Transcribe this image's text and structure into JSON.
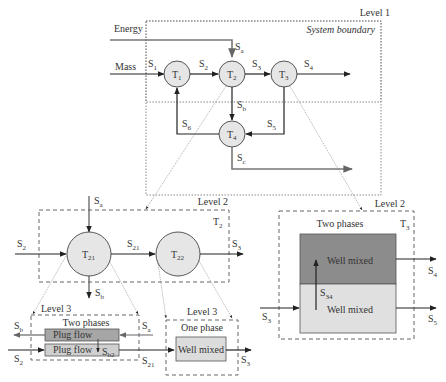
{
  "level1": {
    "label": "Level 1",
    "boundary_label": "System boundary",
    "inputs": {
      "energy": "Energy",
      "mass": "Mass"
    },
    "tanks": [
      {
        "id": "T",
        "sub": "1"
      },
      {
        "id": "T",
        "sub": "2"
      },
      {
        "id": "T",
        "sub": "3"
      },
      {
        "id": "T",
        "sub": "4"
      }
    ],
    "streams": {
      "s1": {
        "s": "S",
        "sub": "1"
      },
      "s2": {
        "s": "S",
        "sub": "2"
      },
      "s3": {
        "s": "S",
        "sub": "3"
      },
      "s4": {
        "s": "S",
        "sub": "4"
      },
      "s5": {
        "s": "S",
        "sub": "5"
      },
      "s6": {
        "s": "S",
        "sub": "6"
      },
      "sa": {
        "s": "S",
        "sub": "a"
      },
      "sb": {
        "s": "S",
        "sub": "b"
      },
      "sc": {
        "s": "S",
        "sub": "c"
      }
    }
  },
  "level2_left": {
    "label": "Level 2",
    "container": {
      "s": "T",
      "sub": "2"
    },
    "tanks": [
      {
        "id": "T",
        "sub": "21"
      },
      {
        "id": "T",
        "sub": "22"
      }
    ],
    "streams": {
      "sa": {
        "s": "S",
        "sub": "a"
      },
      "s2": {
        "s": "S",
        "sub": "2"
      },
      "s21": {
        "s": "S",
        "sub": "21"
      },
      "s3": {
        "s": "S",
        "sub": "3"
      },
      "sb": {
        "s": "S",
        "sub": "b"
      }
    }
  },
  "level3_left": {
    "label": "Level 3",
    "title": "Two phases",
    "upper": "Plug flow",
    "lower": "Plug flow",
    "streams": {
      "sb": {
        "s": "S",
        "sub": "b"
      },
      "sa": {
        "s": "S",
        "sub": "a"
      },
      "s2": {
        "s": "S",
        "sub": "2"
      },
      "s21": {
        "s": "S",
        "sub": "21"
      },
      "sb2": {
        "s": "S",
        "sub": "b2"
      }
    }
  },
  "level3_right": {
    "label": "Level 3",
    "title": "One phase",
    "box": "Well mixed",
    "streams": {
      "s3": {
        "s": "S",
        "sub": "3"
      }
    }
  },
  "level2_right": {
    "label": "Level 2",
    "title": "Two phases",
    "container": {
      "s": "T",
      "sub": "3"
    },
    "upper": "Well mixed",
    "lower": "Well mixed",
    "streams": {
      "s3": {
        "s": "S",
        "sub": "3"
      },
      "s4": {
        "s": "S",
        "sub": "4"
      },
      "s5": {
        "s": "S",
        "sub": "5"
      },
      "s34": {
        "s": "S",
        "sub": "34"
      }
    }
  },
  "colors": {
    "circle_fill": "#e6e6e6",
    "dark_phase": "#8c8c8c",
    "light_phase": "#e0e0e0",
    "plug_upper": "#a6a6a6",
    "plug_lower": "#cfcfcf",
    "line": "#333333",
    "energy_line": "#777777"
  }
}
